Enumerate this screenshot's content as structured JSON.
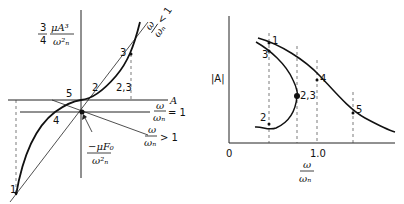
{
  "left_diagram": {
    "y_axis_label": {
      "coef_num": "3",
      "coef_den": "4",
      "num": "μA³",
      "den": "ω²ₙ"
    },
    "x_axis_label": "A",
    "line_labels": {
      "less_than_one": {
        "num": "ω",
        "den": "ωₙ",
        "rel": "< 1"
      },
      "equal_one": {
        "num": "ω",
        "den": "ωₙ",
        "rel": "= 1"
      },
      "greater_than_one": {
        "num": "ω",
        "den": "ωₙ",
        "rel": "> 1"
      }
    },
    "intercept_label": {
      "num": "−μF₀",
      "den": "ω²ₙ"
    },
    "points": [
      {
        "id": "1",
        "label": "1"
      },
      {
        "id": "2",
        "label": "2"
      },
      {
        "id": "3",
        "label": "3"
      },
      {
        "id": "23",
        "label": "2,3"
      },
      {
        "id": "4",
        "label": "4"
      },
      {
        "id": "5",
        "label": "5"
      }
    ]
  },
  "right_diagram": {
    "y_axis_label": "|A|",
    "x_axis_label": {
      "num": "ω",
      "den": "ωₙ"
    },
    "x_ticks": [
      "0",
      "1.0"
    ],
    "points": [
      {
        "id": "1",
        "label": "1"
      },
      {
        "id": "2",
        "label": "2"
      },
      {
        "id": "3",
        "label": "3"
      },
      {
        "id": "23",
        "label": "2,3"
      },
      {
        "id": "4",
        "label": "4"
      },
      {
        "id": "5",
        "label": "5"
      }
    ]
  }
}
